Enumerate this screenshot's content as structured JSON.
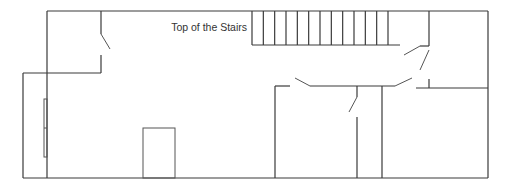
{
  "diagram": {
    "type": "floor-plan",
    "labels": {
      "stairs": "Top of the Stairs"
    },
    "stair_step_count": 13
  }
}
